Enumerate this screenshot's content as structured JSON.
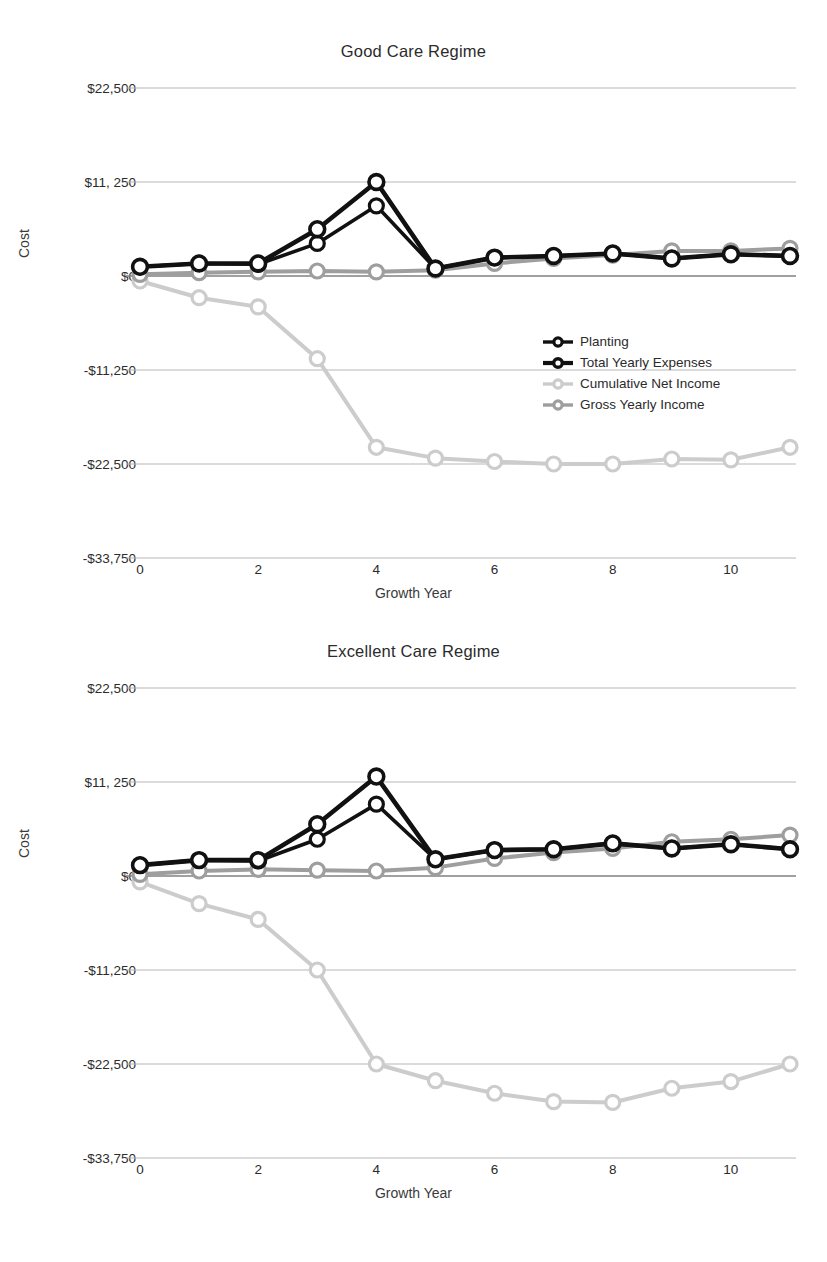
{
  "axis": {
    "ylabel": "Cost",
    "xlabel": "Growth Year",
    "yticks": [
      "$22,500",
      "$11, 250",
      "$0",
      "-$11,250",
      "-$22,500",
      "-$33,750"
    ],
    "xticks": [
      "0",
      "2",
      "4",
      "6",
      "8",
      "10"
    ]
  },
  "colors": {
    "planting": "#111111",
    "total_yearly_expenses": "#111111",
    "cumulative_net_income": "#cccccc",
    "gross_yearly_income": "#9e9e9e",
    "gridline": "#b7b7b7",
    "text": "#2b2b2b"
  },
  "legend": {
    "items": [
      {
        "label": "Planting",
        "color": "#111111"
      },
      {
        "label": "Total Yearly Expenses",
        "color": "#111111"
      },
      {
        "label": "Cumulative Net Income",
        "color": "#cccccc"
      },
      {
        "label": "Gross Yearly Income",
        "color": "#9e9e9e"
      }
    ]
  },
  "chart_data": [
    {
      "type": "line",
      "title": "Good Care Regime",
      "xlabel": "Growth Year",
      "ylabel": "Cost",
      "x": [
        0,
        1,
        2,
        3,
        4,
        5,
        6,
        7,
        8,
        9,
        10,
        11
      ],
      "xlim": [
        0,
        11
      ],
      "ylim": [
        -33750,
        22500
      ],
      "yticks": [
        22500,
        11250,
        0,
        -11250,
        -22500,
        -33750
      ],
      "xticks": [
        0,
        2,
        4,
        6,
        8,
        10
      ],
      "grid": true,
      "legend_position": "middle-right",
      "series": [
        {
          "name": "Planting",
          "color": "#111111",
          "values": [
            1100,
            1500,
            1400,
            3900,
            8400,
            900,
            2200,
            2400,
            2700,
            2100,
            2600,
            2400
          ]
        },
        {
          "name": "Total Yearly Expenses",
          "color": "#111111",
          "values": [
            1100,
            1500,
            1500,
            5600,
            11250,
            900,
            2200,
            2400,
            2700,
            2100,
            2600,
            2400
          ]
        },
        {
          "name": "Cumulative Net Income",
          "color": "#cccccc",
          "values": [
            -600,
            -2600,
            -3700,
            -9900,
            -20500,
            -21800,
            -22200,
            -22500,
            -22500,
            -21900,
            -22000,
            -20500
          ]
        },
        {
          "name": "Gross Yearly Income",
          "color": "#9e9e9e",
          "values": [
            200,
            400,
            500,
            600,
            500,
            700,
            1500,
            2100,
            2500,
            3000,
            3000,
            3300
          ]
        }
      ]
    },
    {
      "type": "line",
      "title": "Excellent Care Regime",
      "xlabel": "Growth Year",
      "ylabel": "Cost",
      "x": [
        0,
        1,
        2,
        3,
        4,
        5,
        6,
        7,
        8,
        9,
        10,
        11
      ],
      "xlim": [
        0,
        11
      ],
      "ylim": [
        -33750,
        22500
      ],
      "yticks": [
        22500,
        11250,
        0,
        -11250,
        -22500,
        -33750
      ],
      "xticks": [
        0,
        2,
        4,
        6,
        8,
        10
      ],
      "grid": true,
      "legend_position": "middle-right",
      "series": [
        {
          "name": "Planting",
          "color": "#111111",
          "values": [
            1300,
            1900,
            1800,
            4400,
            8600,
            2000,
            3100,
            3200,
            3900,
            3300,
            3800,
            3200
          ]
        },
        {
          "name": "Total Yearly Expenses",
          "color": "#111111",
          "values": [
            1300,
            1900,
            1900,
            6200,
            11900,
            2000,
            3100,
            3200,
            3900,
            3300,
            3800,
            3200
          ]
        },
        {
          "name": "Cumulative Net Income",
          "color": "#cccccc",
          "values": [
            -700,
            -3300,
            -5200,
            -11250,
            -22500,
            -24500,
            -26000,
            -27000,
            -27100,
            -25400,
            -24600,
            -22500
          ]
        },
        {
          "name": "Gross Yearly Income",
          "color": "#9e9e9e",
          "values": [
            200,
            600,
            800,
            700,
            600,
            1000,
            2100,
            2800,
            3300,
            4100,
            4400,
            4900
          ]
        }
      ]
    }
  ]
}
